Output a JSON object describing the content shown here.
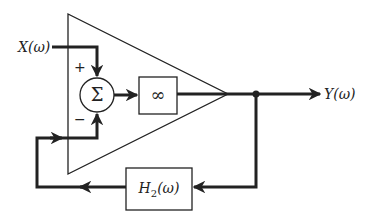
{
  "diagram": {
    "type": "block-diagram",
    "input_label": "X(ω)",
    "output_label": "Y(ω)",
    "summing_junction": {
      "symbol": "Σ",
      "plus_sign": "+",
      "minus_sign": "−"
    },
    "gain_block": {
      "label": "∞"
    },
    "feedback_block": {
      "label_main": "H",
      "label_sub": "2",
      "label_arg": "(ω)"
    },
    "colors": {
      "stroke": "#222222",
      "background": "#ffffff"
    }
  }
}
